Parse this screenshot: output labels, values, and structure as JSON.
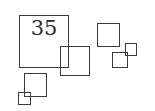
{
  "figure": {
    "label": "35",
    "stroke_color": "#3a3a3a",
    "background": "#ffffff",
    "squares": [
      {
        "id": "large",
        "x": 19,
        "y": 15,
        "w": 50,
        "h": 53
      },
      {
        "id": "overlap-medium",
        "x": 60,
        "y": 46,
        "w": 30,
        "h": 30
      },
      {
        "id": "top-right",
        "x": 97,
        "y": 23,
        "w": 23,
        "h": 24
      },
      {
        "id": "right-small-lower",
        "x": 112,
        "y": 52,
        "w": 16,
        "h": 16
      },
      {
        "id": "right-small-upper",
        "x": 125,
        "y": 43,
        "w": 12,
        "h": 13
      },
      {
        "id": "bottom-left-medium",
        "x": 24,
        "y": 73,
        "w": 23,
        "h": 24
      },
      {
        "id": "bottom-left-small",
        "x": 18,
        "y": 92,
        "w": 13,
        "h": 13
      }
    ]
  }
}
